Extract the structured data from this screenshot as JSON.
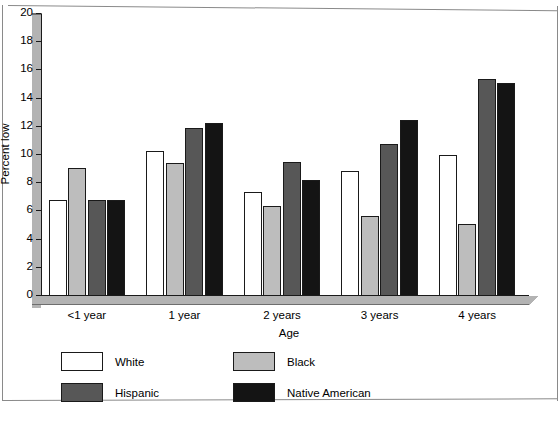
{
  "chart_data": {
    "type": "bar",
    "title": "",
    "xlabel": "Age",
    "ylabel": "Percent low",
    "ylim": [
      0,
      20
    ],
    "yticks": [
      0,
      2,
      4,
      6,
      8,
      10,
      12,
      14,
      16,
      18,
      20
    ],
    "grid": false,
    "legend_position": "below-plot-left",
    "categories": [
      "<1 year",
      "1 year",
      "2 years",
      "3 years",
      "4 years"
    ],
    "series": [
      {
        "name": "White",
        "color": "#ffffff",
        "values": [
          6.8,
          10.3,
          7.4,
          8.9,
          10.0
        ]
      },
      {
        "name": "Black",
        "color": "#bdbdbd",
        "values": [
          9.1,
          9.4,
          6.4,
          5.7,
          5.1
        ]
      },
      {
        "name": "Hispanic",
        "color": "#575757",
        "values": [
          6.8,
          11.9,
          9.5,
          10.8,
          15.4
        ]
      },
      {
        "name": "Native American",
        "color": "#141414",
        "values": [
          6.8,
          12.3,
          8.2,
          12.5,
          15.1
        ]
      }
    ]
  },
  "colors": {
    "axis": "#1a1a1a",
    "axis_slab": "#b3b3b3",
    "frame": "#8a8a8a",
    "background": "#ffffff"
  }
}
